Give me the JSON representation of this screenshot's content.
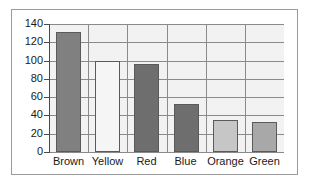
{
  "chart_data": {
    "type": "bar",
    "title": "",
    "subtitle": "",
    "xlabel": "",
    "ylabel": "",
    "categories": [
      "Brown",
      "Yellow",
      "Red",
      "Blue",
      "Orange",
      "Green"
    ],
    "values": [
      131,
      100,
      96,
      52,
      35,
      33
    ],
    "bar_colors": [
      "#808080",
      "#f5f5f5",
      "#6e6e6e",
      "#6e6e6e",
      "#c6c6c6",
      "#a8a8a8"
    ],
    "bar_border_color": "#5a5a5a",
    "ylim": [
      0,
      140
    ],
    "yticks": [
      0,
      20,
      40,
      60,
      80,
      100,
      120,
      140
    ],
    "ytick_labels": [
      "0",
      "20",
      "40",
      "60",
      "80",
      "100",
      "120",
      "140"
    ],
    "grid": true,
    "grid_axis": "both",
    "grid_color": "#8a8a8a",
    "legend": false,
    "legend_position": "none",
    "plot_background": "#f2f2f2",
    "figure_background": "#ffffff",
    "frame_border_color": "#9a9a9a"
  }
}
